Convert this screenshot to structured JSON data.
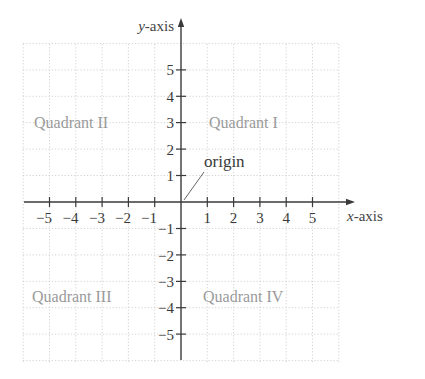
{
  "diagram": {
    "y_axis_label_var": "y",
    "y_axis_label_rest": "-axis",
    "x_axis_label_var": "x",
    "x_axis_label_rest": "-axis",
    "origin_label": "origin",
    "quadrants": {
      "q1": "Quadrant I",
      "q2": "Quadrant II",
      "q3": "Quadrant III",
      "q4": "Quadrant IV"
    },
    "x_ticks": {
      "neg5": "−5",
      "neg4": "−4",
      "neg3": "−3",
      "neg2": "−2",
      "neg1": "−1",
      "pos1": "1",
      "pos2": "2",
      "pos3": "3",
      "pos4": "4",
      "pos5": "5"
    },
    "y_ticks": {
      "pos5": "5",
      "pos4": "4",
      "pos3": "3",
      "pos2": "2",
      "pos1": "1",
      "neg1": "−1",
      "neg2": "−2",
      "neg3": "−3",
      "neg4": "−4",
      "neg5": "−5"
    },
    "grid_range": {
      "x": [
        -6,
        6
      ],
      "y": [
        -6,
        6
      ]
    },
    "colors": {
      "axis": "#3a3a3a",
      "grid": "#c8c8c8",
      "quadrant_text": "#9a9a9a"
    }
  }
}
